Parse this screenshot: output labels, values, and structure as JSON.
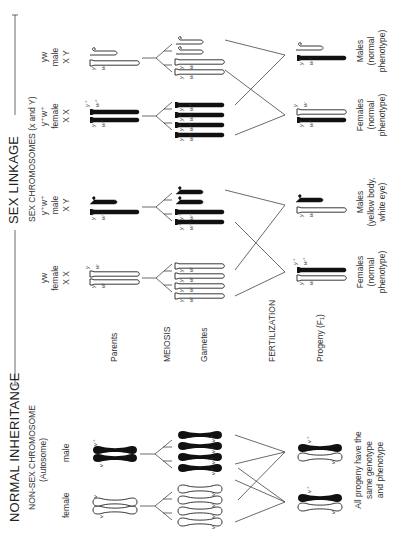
{
  "normal": {
    "title": "NORMAL INHERITANCE",
    "subtitle_line1": "NON-SEX CHROMOSOME",
    "subtitle_line2": "(Autosome)",
    "female_label": "female",
    "male_label": "male",
    "parent_female_genes": [
      "v",
      "v"
    ],
    "parent_male_genes": [
      "v⁺",
      "v⁺"
    ],
    "gamete_genes": [
      "v",
      "v",
      "v",
      "v",
      "v⁺",
      "v⁺",
      "v⁺",
      "v⁺"
    ],
    "progeny_genes": [
      [
        "v",
        "v⁺"
      ],
      [
        "v",
        "v⁺"
      ]
    ],
    "conclusion_line1": "All progeny have the",
    "conclusion_line2": "same genotype",
    "conclusion_line3": "and phenotype"
  },
  "stages": {
    "parents": "Parents",
    "meiosis": "MEIOSIS",
    "gametes": "Gametes",
    "fertilization": "FERTILIZATION",
    "progeny": "Progeny (F₁)"
  },
  "sex_linkage": {
    "title": "SEX LINKAGE",
    "subtitle": "SEX CHROMOSOMES (x and Y)",
    "cross1": {
      "female": {
        "genotype": "yw",
        "label": "female",
        "chromosomes": "X X",
        "genes": [
          "y",
          "w",
          "y",
          "w"
        ]
      },
      "male": {
        "genotype": "y⁺w⁺",
        "label": "male",
        "chromosomes": "X Y",
        "genes": [
          "y⁺",
          "w⁺"
        ]
      },
      "gamete_genes": [
        [
          "y",
          "w"
        ],
        [
          "y",
          "w"
        ],
        [
          "y",
          "w"
        ],
        [
          "y",
          "w"
        ],
        [
          "y⁺",
          "w⁺"
        ],
        [
          "y⁺",
          "w⁺"
        ]
      ],
      "progeny_female_genes": [
        "y",
        "w",
        "y⁺",
        "w⁺"
      ],
      "progeny_male_genes": [
        "y",
        "w"
      ],
      "females_label_line1": "Females",
      "females_label_line2": "(normal",
      "females_label_line3": "phenotype)",
      "males_label_line1": "Males",
      "males_label_line2": "(yellow body,",
      "males_label_line3": "white eye)"
    },
    "cross2": {
      "female": {
        "genotype": "y⁺w⁺",
        "label": "female",
        "chromosomes": "X X",
        "genes": [
          "y⁺",
          "w⁺",
          "y⁺",
          "w⁺"
        ]
      },
      "male": {
        "genotype": "yw",
        "label": "male",
        "chromosomes": "X Y",
        "genes": [
          "y",
          "w"
        ]
      },
      "gamete_genes": [
        [
          "y⁺",
          "w⁺"
        ],
        [
          "y⁺",
          "w⁺"
        ],
        [
          "y⁺",
          "w⁺"
        ],
        [
          "y⁺",
          "w⁺"
        ],
        [
          "y",
          "w"
        ],
        [
          "y",
          "w"
        ]
      ],
      "progeny_female_genes": [
        "y⁺",
        "w⁺",
        "y",
        "w"
      ],
      "progeny_male_genes": [
        "y⁺",
        "w⁺"
      ],
      "females_label_line1": "Females",
      "females_label_line2": "(normal",
      "females_label_line3": "phenotype)",
      "males_label_line1": "Males",
      "males_label_line2": "(normal",
      "males_label_line3": "phenotype)"
    }
  },
  "colors": {
    "ink": "#222222",
    "line": "#555555",
    "background": "#ffffff"
  }
}
